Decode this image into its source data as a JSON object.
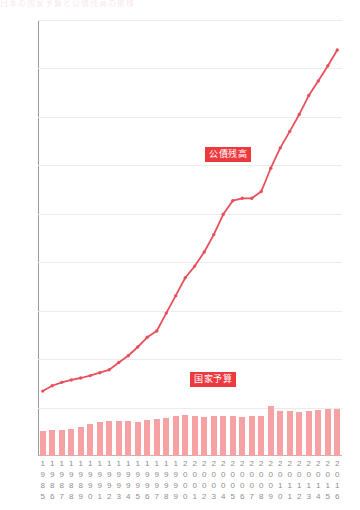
{
  "caption_sliver": "日本の国家予算と公債残高の推移",
  "chart_data": {
    "type": "bar",
    "title": "",
    "xlabel": "",
    "ylabel": "",
    "yunit": "(兆円)",
    "ylim": [
      0,
      900
    ],
    "yticks": [
      900,
      800,
      700,
      600,
      500,
      400,
      300,
      200,
      100
    ],
    "grid": true,
    "legend_position": "inline-annotation",
    "categories": [
      "1985",
      "1986",
      "1987",
      "1988",
      "1989",
      "1990",
      "1991",
      "1992",
      "1993",
      "1994",
      "1995",
      "1996",
      "1997",
      "1998",
      "1999",
      "2000",
      "2001",
      "2002",
      "2003",
      "2004",
      "2005",
      "2006",
      "2007",
      "2008",
      "2009",
      "2010",
      "2011",
      "2012",
      "2013",
      "2014",
      "2015",
      "2016"
    ],
    "series": [
      {
        "name": "国家予算",
        "type": "bar",
        "color": "#f6a2a4",
        "values": [
          52.5,
          54.1,
          54.1,
          56.7,
          60.4,
          66.2,
          70.3,
          72.2,
          72.4,
          73.1,
          70.9,
          75.1,
          77.4,
          77.7,
          81.9,
          85.0,
          82.7,
          81.2,
          81.8,
          82.1,
          82.2,
          79.7,
          82.9,
          83.1,
          102.5,
          92.3,
          92.4,
          90.3,
          92.6,
          95.9,
          96.3,
          96.7
        ]
      },
      {
        "name": "公債残高",
        "type": "line",
        "color": "#e8505c",
        "values": [
          134,
          145,
          152,
          157,
          161,
          166,
          172,
          178,
          193,
          207,
          225,
          245,
          258,
          295,
          331,
          368,
          392,
          421,
          457,
          499,
          527,
          532,
          532,
          546,
          594,
          636,
          670,
          705,
          744,
          774,
          805,
          838
        ]
      }
    ],
    "annotations": [
      {
        "text": "公債残高",
        "x_year": "2007",
        "value_y": 600
      },
      {
        "text": "国家予算",
        "x_year": "2004",
        "value_y": 130
      }
    ]
  }
}
